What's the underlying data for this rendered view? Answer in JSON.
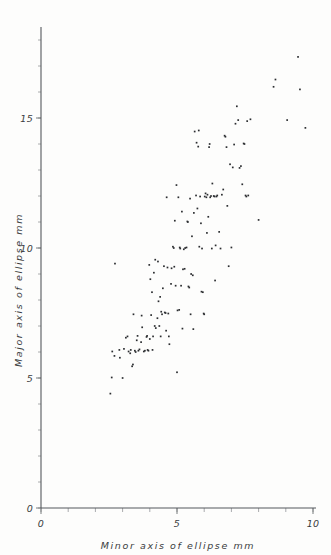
{
  "chart_data": {
    "type": "scatter",
    "title": "",
    "xlabel": "Minor axis of ellipse   mm",
    "ylabel": "Major axis of ellipse   mm",
    "xlim": [
      0,
      10
    ],
    "ylim": [
      0,
      18.5
    ],
    "xticks": [
      0,
      5,
      10
    ],
    "yticks": [
      0,
      5,
      10,
      15
    ],
    "xtick_labels": [
      "0",
      "5",
      "10"
    ],
    "ytick_labels": [
      "0",
      "5",
      "10",
      "15"
    ],
    "minor_tick_step": 1,
    "grid": false,
    "legend": null,
    "marker": "dot",
    "marker_color": "#2b2d30",
    "series_name": "ellipse measurements",
    "points": [
      [
        2.55,
        4.4
      ],
      [
        2.6,
        5.02
      ],
      [
        2.62,
        6.02
      ],
      [
        2.7,
        5.85
      ],
      [
        2.72,
        9.4
      ],
      [
        2.88,
        6.08
      ],
      [
        2.9,
        5.78
      ],
      [
        3.0,
        5.0
      ],
      [
        3.05,
        6.12
      ],
      [
        3.12,
        6.55
      ],
      [
        3.18,
        6.6
      ],
      [
        3.22,
        6.02
      ],
      [
        3.28,
        5.95
      ],
      [
        3.3,
        6.08
      ],
      [
        3.35,
        5.45
      ],
      [
        3.38,
        5.52
      ],
      [
        3.4,
        7.45
      ],
      [
        3.45,
        6.05
      ],
      [
        3.48,
        6.0
      ],
      [
        3.52,
        6.45
      ],
      [
        3.55,
        6.62
      ],
      [
        3.58,
        6.05
      ],
      [
        3.62,
        6.1
      ],
      [
        3.68,
        6.38
      ],
      [
        3.7,
        7.4
      ],
      [
        3.72,
        6.95
      ],
      [
        3.78,
        6.02
      ],
      [
        3.82,
        6.05
      ],
      [
        3.88,
        6.58
      ],
      [
        3.9,
        6.62
      ],
      [
        3.92,
        6.08
      ],
      [
        3.95,
        6.05
      ],
      [
        3.98,
        9.35
      ],
      [
        4.0,
        6.5
      ],
      [
        4.02,
        8.8
      ],
      [
        4.05,
        7.42
      ],
      [
        4.08,
        8.3
      ],
      [
        4.1,
        6.08
      ],
      [
        4.12,
        6.6
      ],
      [
        4.15,
        9.05
      ],
      [
        4.18,
        7.0
      ],
      [
        4.2,
        9.55
      ],
      [
        4.22,
        6.92
      ],
      [
        4.28,
        7.3
      ],
      [
        4.3,
        9.48
      ],
      [
        4.32,
        7.95
      ],
      [
        4.35,
        7.0
      ],
      [
        4.38,
        8.12
      ],
      [
        4.4,
        6.6
      ],
      [
        4.42,
        7.55
      ],
      [
        4.45,
        7.45
      ],
      [
        4.48,
        8.45
      ],
      [
        4.52,
        9.3
      ],
      [
        4.55,
        7.52
      ],
      [
        4.58,
        7.5
      ],
      [
        4.6,
        6.82
      ],
      [
        4.62,
        11.95
      ],
      [
        4.65,
        9.25
      ],
      [
        4.68,
        7.48
      ],
      [
        4.7,
        6.6
      ],
      [
        4.72,
        6.3
      ],
      [
        4.78,
        8.62
      ],
      [
        4.8,
        9.22
      ],
      [
        4.85,
        10.05
      ],
      [
        4.88,
        10.0
      ],
      [
        4.9,
        9.28
      ],
      [
        4.92,
        11.05
      ],
      [
        4.95,
        8.55
      ],
      [
        4.98,
        12.42
      ],
      [
        5.0,
        5.22
      ],
      [
        5.02,
        7.6
      ],
      [
        5.05,
        11.95
      ],
      [
        5.08,
        7.62
      ],
      [
        5.1,
        10.02
      ],
      [
        5.12,
        9.98
      ],
      [
        5.15,
        8.55
      ],
      [
        5.18,
        11.4
      ],
      [
        5.2,
        6.9
      ],
      [
        5.22,
        9.18
      ],
      [
        5.25,
        9.95
      ],
      [
        5.28,
        9.2
      ],
      [
        5.3,
        10.0
      ],
      [
        5.35,
        10.02
      ],
      [
        5.38,
        11.02
      ],
      [
        5.4,
        11.0
      ],
      [
        5.42,
        8.52
      ],
      [
        5.45,
        8.48
      ],
      [
        5.48,
        11.9
      ],
      [
        5.5,
        7.45
      ],
      [
        5.52,
        9.0
      ],
      [
        5.55,
        10.45
      ],
      [
        5.58,
        8.95
      ],
      [
        5.6,
        6.88
      ],
      [
        5.62,
        11.35
      ],
      [
        5.65,
        14.48
      ],
      [
        5.7,
        12.02
      ],
      [
        5.72,
        14.05
      ],
      [
        5.75,
        11.52
      ],
      [
        5.78,
        13.9
      ],
      [
        5.8,
        14.52
      ],
      [
        5.82,
        10.05
      ],
      [
        5.85,
        11.98
      ],
      [
        5.88,
        10.95
      ],
      [
        5.9,
        8.32
      ],
      [
        5.92,
        9.98
      ],
      [
        5.95,
        8.3
      ],
      [
        5.98,
        7.48
      ],
      [
        6.0,
        7.45
      ],
      [
        6.02,
        11.98
      ],
      [
        6.05,
        12.1
      ],
      [
        6.08,
        11.95
      ],
      [
        6.1,
        10.58
      ],
      [
        6.12,
        12.05
      ],
      [
        6.15,
        11.2
      ],
      [
        6.18,
        13.88
      ],
      [
        6.2,
        14.0
      ],
      [
        6.22,
        11.95
      ],
      [
        6.25,
        12.0
      ],
      [
        6.28,
        9.98
      ],
      [
        6.3,
        12.48
      ],
      [
        6.35,
        12.0
      ],
      [
        6.38,
        11.98
      ],
      [
        6.4,
        8.75
      ],
      [
        6.42,
        10.1
      ],
      [
        6.45,
        11.98
      ],
      [
        6.48,
        12.02
      ],
      [
        6.55,
        10.62
      ],
      [
        6.6,
        9.98
      ],
      [
        6.65,
        12.05
      ],
      [
        6.7,
        12.25
      ],
      [
        6.75,
        14.32
      ],
      [
        6.78,
        14.28
      ],
      [
        6.82,
        13.88
      ],
      [
        6.85,
        11.62
      ],
      [
        6.9,
        9.3
      ],
      [
        6.95,
        13.22
      ],
      [
        7.0,
        10.02
      ],
      [
        7.05,
        13.1
      ],
      [
        7.1,
        13.98
      ],
      [
        7.15,
        14.78
      ],
      [
        7.2,
        15.45
      ],
      [
        7.25,
        14.92
      ],
      [
        7.3,
        13.08
      ],
      [
        7.35,
        13.15
      ],
      [
        7.4,
        12.45
      ],
      [
        7.45,
        14.02
      ],
      [
        7.48,
        14.0
      ],
      [
        7.52,
        12.02
      ],
      [
        7.55,
        11.98
      ],
      [
        7.58,
        14.88
      ],
      [
        7.62,
        12.02
      ],
      [
        7.7,
        14.95
      ],
      [
        8.0,
        11.08
      ],
      [
        8.55,
        16.2
      ],
      [
        8.62,
        16.48
      ],
      [
        9.05,
        14.92
      ],
      [
        9.45,
        17.35
      ],
      [
        9.52,
        16.1
      ],
      [
        9.72,
        14.62
      ]
    ]
  },
  "axis": {
    "x_title": "Minor axis of ellipse   mm",
    "y_title": "Major axis of ellipse   mm",
    "x_labels": [
      "0",
      "5",
      "10"
    ],
    "y_labels": [
      "0",
      "5",
      "10",
      "15"
    ],
    "origin_label": "0"
  }
}
